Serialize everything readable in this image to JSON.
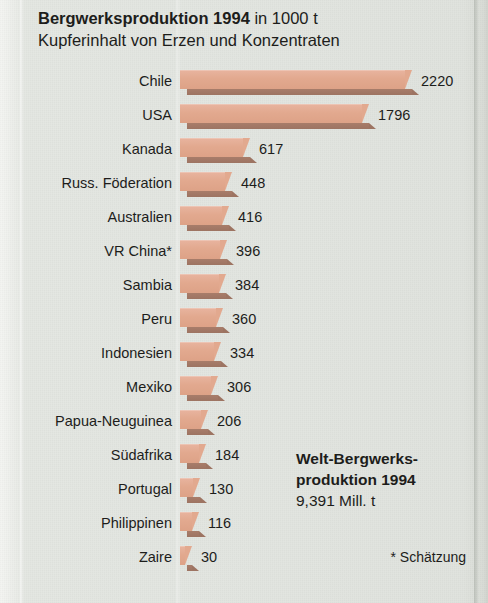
{
  "title": {
    "bold_part": "Bergwerksproduktion 1994",
    "regular_part": " in 1000 t",
    "subtitle": "Kupferinhalt von Erzen und Konzentraten"
  },
  "summary": {
    "line1": "Welt-Bergwerks-",
    "line2": "produktion 1994",
    "line3": "9,391 Mill. t"
  },
  "footnote": "* Schätzung",
  "colors": {
    "background": "#e2e5e0",
    "bar_fill": "#e2a98f",
    "bar_shadow": "#9d7462",
    "text": "#1d1d1b"
  },
  "chart_data": {
    "type": "bar",
    "orientation": "horizontal",
    "title": "Bergwerksproduktion 1994 in 1000 t",
    "subtitle": "Kupferinhalt von Erzen und Konzentraten",
    "xlabel": "1000 t",
    "ylabel": "",
    "grid": false,
    "legend": "none",
    "xlim": [
      0,
      2220
    ],
    "categories": [
      "Chile",
      "USA",
      "Kanada",
      "Russ. Föderation",
      "Australien",
      "VR China*",
      "Sambia",
      "Peru",
      "Indonesien",
      "Mexiko",
      "Papua-Neuguinea",
      "Südafrika",
      "Portugal",
      "Philippinen",
      "Zaire"
    ],
    "values": [
      2220,
      1796,
      617,
      448,
      416,
      396,
      384,
      360,
      334,
      306,
      206,
      184,
      130,
      116,
      30
    ],
    "value_labels": [
      "2220",
      "1796",
      "617",
      "448",
      "416",
      "396",
      "384",
      "360",
      "334",
      "306",
      "206",
      "184",
      "130",
      "116",
      "30"
    ],
    "annotations": [
      "Welt-Bergwerksproduktion 1994 9,391 Mill. t",
      "* Schätzung"
    ]
  }
}
